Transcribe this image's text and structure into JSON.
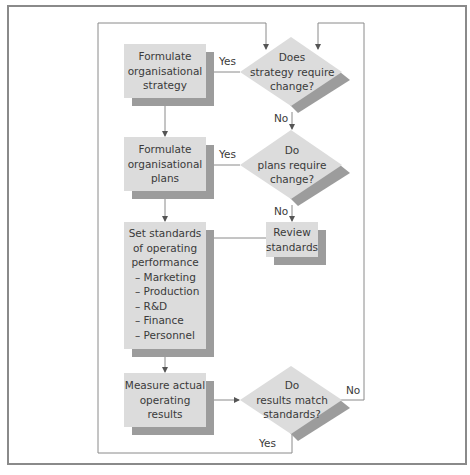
{
  "diagram": {
    "colors": {
      "box_fill": "#dcdcdc",
      "shadow": "#9c9c9c",
      "line": "#8a8a8a",
      "text": "#3a3a3a"
    },
    "nodes": {
      "formulate_strategy": {
        "lines": [
          "Formulate",
          "organisational",
          "strategy"
        ]
      },
      "strategy_decision": {
        "lines": [
          "Does",
          "strategy require",
          "change?"
        ]
      },
      "formulate_plans": {
        "lines": [
          "Formulate",
          "organisational",
          "plans"
        ]
      },
      "plans_decision": {
        "lines": [
          "Do",
          "plans require",
          "change?"
        ]
      },
      "review_standards": {
        "lines": [
          "Review",
          "standards"
        ]
      },
      "set_standards": {
        "lines": [
          "Set standards",
          "of operating",
          "performance"
        ],
        "items": [
          "– Marketing",
          "– Production",
          "– R&D",
          "– Finance",
          "– Personnel"
        ]
      },
      "measure_results": {
        "lines": [
          "Measure actual",
          "operating",
          "results"
        ]
      },
      "results_decision": {
        "lines": [
          "Do",
          "results match",
          "standards?"
        ]
      }
    },
    "edge_labels": {
      "strategy_yes": "Yes",
      "strategy_no": "No",
      "plans_yes": "Yes",
      "plans_no": "No",
      "results_no": "No",
      "results_yes": "Yes"
    }
  }
}
